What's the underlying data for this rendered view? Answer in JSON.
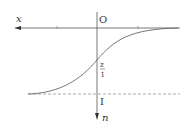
{
  "diagram": {
    "labels": {
      "x_axis": "x",
      "origin": "O",
      "vertical_axis": "n",
      "midpoint_top": "z",
      "midpoint_bottom": "1",
      "asymptote": "I"
    },
    "colors": {
      "axis": "#555555",
      "curve": "#666666",
      "dashed": "#888888",
      "text": "#333333"
    }
  }
}
